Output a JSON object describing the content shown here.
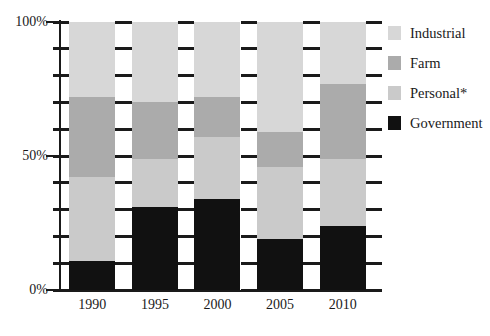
{
  "chart_data": {
    "type": "bar",
    "subtype": "stacked-percentage",
    "title": "",
    "subtitle": "",
    "xlabel": "",
    "ylabel": "",
    "categories": [
      "1990",
      "1995",
      "2000",
      "2005",
      "2010"
    ],
    "ylim": [
      0,
      100
    ],
    "ytick_labels": [
      "0%",
      "50%",
      "100%"
    ],
    "ytick_values": [
      0,
      50,
      100
    ],
    "yminor_tick_values": [
      0,
      10,
      20,
      30,
      40,
      50,
      60,
      70,
      80,
      90,
      100
    ],
    "grid": false,
    "legend_position": "right",
    "units": "percent",
    "series": [
      {
        "name": "Government",
        "color": "#111111",
        "values": [
          11,
          31,
          34,
          19,
          24
        ]
      },
      {
        "name": "Personal*",
        "color": "#cacaca",
        "values": [
          31,
          18,
          23,
          27,
          25
        ]
      },
      {
        "name": "Farm",
        "color": "#ababab",
        "values": [
          30,
          21,
          15,
          13,
          28
        ]
      },
      {
        "name": "Industrial",
        "color": "#d7d7d7",
        "values": [
          28,
          30,
          28,
          41,
          23
        ]
      }
    ],
    "stack_order_bottom_to_top": [
      "Government",
      "Personal*",
      "Farm",
      "Industrial"
    ],
    "cumulative_tops": {
      "1990": {
        "Government": 11,
        "Personal*": 42,
        "Farm": 72,
        "Industrial": 100
      },
      "1995": {
        "Government": 31,
        "Personal*": 49,
        "Farm": 70,
        "Industrial": 100
      },
      "2000": {
        "Government": 34,
        "Personal*": 57,
        "Farm": 72,
        "Industrial": 100
      },
      "2005": {
        "Government": 19,
        "Personal*": 46,
        "Farm": 59,
        "Industrial": 100
      },
      "2010": {
        "Government": 24,
        "Personal*": 49,
        "Farm": 77,
        "Industrial": 100
      }
    }
  },
  "legend": {
    "items": [
      {
        "label": "Industrial",
        "color": "#d7d7d7"
      },
      {
        "label": "Farm",
        "color": "#ababab"
      },
      {
        "label": "Personal*",
        "color": "#cacaca"
      },
      {
        "label": "Government",
        "color": "#111111"
      }
    ]
  },
  "axis_colors": {
    "axis": "#1a1a1a",
    "text": "#1a1a1a",
    "background": "#ffffff"
  }
}
